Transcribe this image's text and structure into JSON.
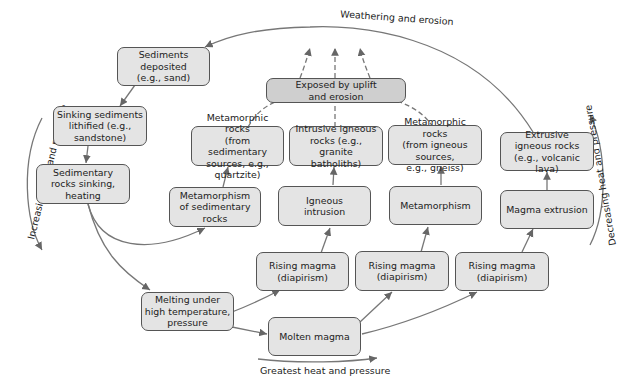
{
  "boxes": {
    "sediments_deposited": "Sediments\ndeposited\n(e.g., sand)",
    "sinking_sediments": "Sinking sediments\nlithified (e.g.,\nsandstone)",
    "sedimentary_rocks_sinking": "Sedimentary\nrocks sinking,\nheating",
    "exposed": "Exposed by uplift\nand erosion",
    "metamorphic_sed": "Metamorphic rocks\n(from sedimentary\nsources, e.g., quartzite)",
    "intrusive_igneous": "Intrusive igneous\nrocks (e.g., granite\nbatholiths)",
    "metamorphic_ign": "Metamorphic rocks\n(from igneous sources,\ne.g., gneiss)",
    "extrusive_igneous": "Extrusive\nigneous rocks\n(e.g., volcanic lava)",
    "metamorphism_sed": "Metamorphism\nof sedimentary\nrocks",
    "igneous_intrusion": "Igneous\nintrusion",
    "metamorphism": "Metamorphism",
    "magma_extrusion": "Magma extrusion",
    "rising_magma_1": "Rising magma\n(diapirism)",
    "rising_magma_2": "Rising magma\n(diapirism)",
    "rising_magma_3": "Rising magma\n(diapirism)",
    "melting": "Melting under\nhigh temperature,\npressure",
    "molten_magma": "Molten magma"
  },
  "labels": {
    "weathering": "Weathering and erosion",
    "increasing": "Increasing heat and pressure",
    "decreasing": "Decreasing heat and pressure",
    "greatest": "Greatest heat and pressure"
  },
  "colors": {
    "box_fill": "#e4e4e4",
    "box_fill_dark": "#cfcfcf",
    "line": "#666666"
  }
}
